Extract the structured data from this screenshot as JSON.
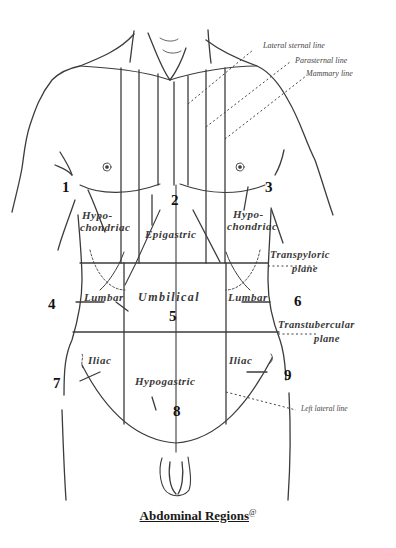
{
  "figure": {
    "caption": "Abdominal Regions",
    "caption_mark": "@",
    "line_labels": {
      "lateral_sternal": "Lateral sternal line",
      "parasternal": "Parasternal line",
      "mammary": "Mammary line",
      "left_lateral": "Left lateral line"
    },
    "planes": {
      "transpyloric": [
        "Transpyloric",
        "plane"
      ],
      "transtubercular": [
        "Transtubercular",
        "plane"
      ]
    },
    "regions": [
      {
        "number": "1",
        "name": [
          "Hypo-",
          "chondriac"
        ]
      },
      {
        "number": "2",
        "name": [
          "Epigastric"
        ]
      },
      {
        "number": "3",
        "name": [
          "Hypo-",
          "chondriac"
        ]
      },
      {
        "number": "4",
        "name": [
          "Lumbar"
        ]
      },
      {
        "number": "5",
        "name": [
          "Umbilical"
        ]
      },
      {
        "number": "6",
        "name": [
          "Lumbar"
        ]
      },
      {
        "number": "7",
        "name": [
          "Iliac"
        ]
      },
      {
        "number": "8",
        "name": [
          "Hypogastric"
        ]
      },
      {
        "number": "9",
        "name": [
          "Iliac"
        ]
      }
    ],
    "colors": {
      "line": "#3c3c3c",
      "background": "#ffffff"
    }
  }
}
